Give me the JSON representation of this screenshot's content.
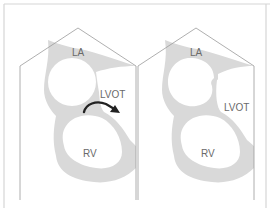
{
  "panels": [
    {
      "id": "left",
      "labels": {
        "la": "LA",
        "lvot": "LVOT",
        "rv": "RV"
      },
      "has_arrow": true
    },
    {
      "id": "right",
      "labels": {
        "la": "LA",
        "lvot": "LVOT",
        "rv": "RV"
      },
      "has_arrow": false
    }
  ],
  "colors": {
    "outline": "#9a9a9a",
    "tissue": "#d9d9d9",
    "border": "#cfcfcf",
    "arrow": "#222222",
    "label": "#6a6a6a"
  }
}
